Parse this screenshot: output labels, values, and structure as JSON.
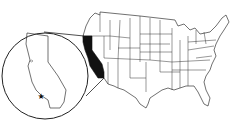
{
  "map": {
    "title": "United States map highlighting California",
    "highlighted_state": "California",
    "inset": {
      "subject": "California",
      "marker": "star",
      "marker_location": "Southern California (Los Angeles area)"
    },
    "colors": {
      "background": "#ffffff",
      "outline": "#333333",
      "highlight_fill": "#111111"
    }
  }
}
